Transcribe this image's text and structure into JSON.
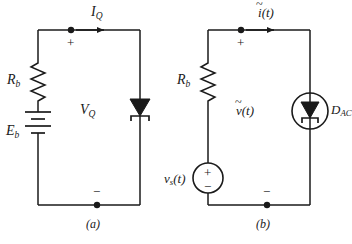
{
  "figure": {
    "type": "circuit-schematic-pair",
    "background_color": "#ffffff",
    "line_color": "#1a1a1a"
  },
  "circuit_a": {
    "caption": "(a)",
    "resistor_label": "R",
    "resistor_subscript": "b",
    "source_label": "E",
    "source_subscript": "b",
    "source_type": "battery",
    "current_label": "I",
    "current_subscript": "Q",
    "voltage_label": "V",
    "voltage_subscript": "Q",
    "polarity_plus": "+",
    "polarity_minus": "−",
    "diode_type": "tunnel-diode",
    "diode_label": ""
  },
  "circuit_b": {
    "caption": "(b)",
    "resistor_label": "R",
    "resistor_subscript": "b",
    "source_label": "v",
    "source_subscript": "s",
    "source_arg": "(t)",
    "source_type": "ac-voltage-source",
    "source_plus": "+",
    "source_minus": "−",
    "current_label": "i",
    "current_arg": "(t)",
    "current_tilde": "~",
    "voltage_label": "v",
    "voltage_arg": "(t)",
    "voltage_tilde": "~",
    "polarity_plus": "+",
    "polarity_minus": "−",
    "diode_type": "tunnel-diode-in-circle",
    "diode_label": "D",
    "diode_subscript": "AC"
  }
}
